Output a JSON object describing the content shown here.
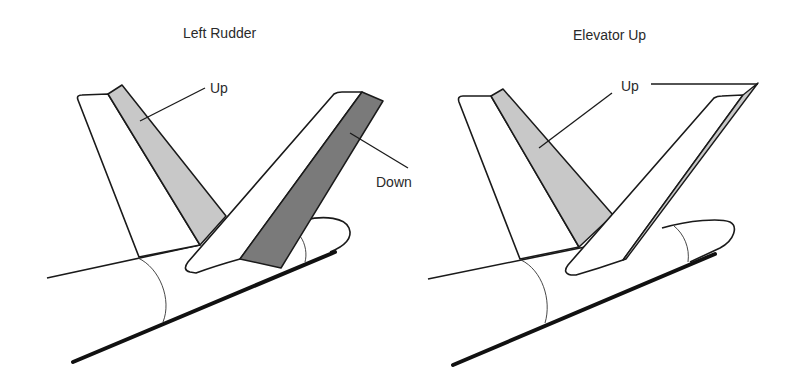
{
  "diagrams": [
    {
      "title": "Left Rudder",
      "labels": {
        "rudder_label": "Up",
        "elevator_label": "Down"
      },
      "surfaces": {
        "vertical_surface_state": "Up",
        "horizontal_surface_state": "Down"
      }
    },
    {
      "title": "Elevator Up",
      "labels": {
        "shared_label": "Up"
      },
      "surfaces": {
        "vertical_surface_state": "Up",
        "horizontal_surface_state": "Up"
      }
    }
  ],
  "colors": {
    "background": "#ffffff",
    "outline": "#1a1a1a",
    "light_surface": "#c8c8c8",
    "dark_surface": "#7a7a7a",
    "text": "#2a2a2a"
  }
}
